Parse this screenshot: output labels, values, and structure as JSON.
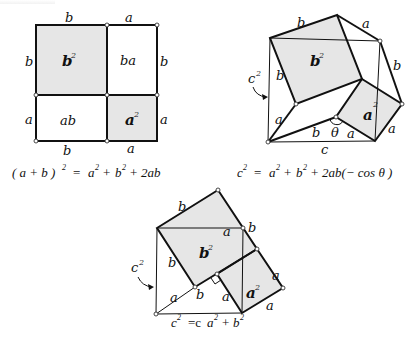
{
  "figures": [
    {
      "id": "square-expansion",
      "labels": {
        "top_left": "b",
        "top_right": "a",
        "left_top": "b",
        "left_bottom": "a",
        "right_top": "b",
        "right_bottom": "a",
        "bottom_left": "b",
        "bottom_right": "a",
        "region_b2": "b",
        "region_b2_exp": "2",
        "region_ba": "ba",
        "region_ab": "ab",
        "region_a2": "a",
        "region_a2_exp": "2"
      },
      "formula": {
        "lhs": "( a + b )",
        "lhs_exp": "2",
        "eq": "=",
        "rhs_a": "a",
        "rhs_a_exp": "2",
        "plus1": "+",
        "rhs_b": "b",
        "rhs_b_exp": "2",
        "plus2": "+",
        "rhs_2ab": "2ab"
      }
    },
    {
      "id": "law-of-cosines",
      "labels": {
        "c2": "c",
        "c2_exp": "2",
        "top_b": "b",
        "top_a": "a",
        "left_b": "b",
        "right_b": "b",
        "region_b2": "b",
        "region_b2_exp": "2",
        "region_a2": "a",
        "region_a2_exp": "2",
        "lower_a": "a",
        "lower_b": "b",
        "theta": "θ",
        "lower_a2": "a",
        "right_a": "a",
        "bottom_c": "c"
      },
      "formula": {
        "lhs": "c",
        "lhs_exp": "2",
        "eq": "=",
        "rhs_a": "a",
        "rhs_a_exp": "2",
        "plus1": "+",
        "rhs_b": "b",
        "rhs_b_exp": "2",
        "plus2": "+",
        "rhs_tail": "2ab(− cos θ )"
      }
    },
    {
      "id": "pythagorean",
      "labels": {
        "c2": "c",
        "c2_exp": "2",
        "top_b": "b",
        "top_a": "a",
        "corner_b": "b",
        "left_b": "b",
        "region_b2": "b",
        "region_b2_exp": "2",
        "region_a2": "a",
        "region_a2_exp": "2",
        "lower_a": "a",
        "lower_b": "b",
        "lower_a2": "a",
        "right_a": "a",
        "bottom_a": "a"
      },
      "formula": {
        "lhs": "c",
        "lhs_exp": "2",
        "eq": "=c",
        "rhs_a": "a",
        "rhs_a_exp": "2",
        "plus1": "+",
        "rhs_b": "b",
        "rhs_b_exp": "2"
      }
    }
  ],
  "colors": {
    "shade": "#e6e6e6",
    "line": "#111111",
    "background": "#ffffff"
  }
}
